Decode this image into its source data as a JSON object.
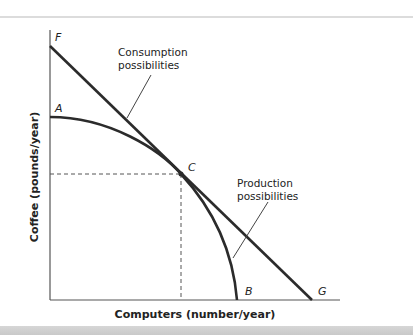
{
  "figure": {
    "x_axis_label": "Computers (number/year)",
    "y_axis_label": "Coffee (pounds/year)",
    "points": {
      "F": "F",
      "A": "A",
      "C": "C",
      "B": "B",
      "G": "G"
    },
    "annotations": {
      "consumption_line1": "Consumption",
      "consumption_line2": "possibilities",
      "production_line1": "Production",
      "production_line2": "possibilities"
    },
    "colors": {
      "curve": "#2b2b2b",
      "axis": "#555555",
      "dashed": "#555555"
    }
  }
}
